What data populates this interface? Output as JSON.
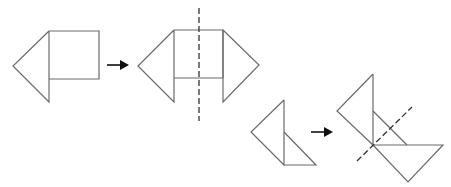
{
  "diagram": {
    "colors": {
      "stroke": "#6b6b6b",
      "dash": "#333333",
      "arrow": "#111111",
      "background": "#ffffff"
    },
    "steps": [
      {
        "id": "step1-before",
        "description": "Square with a triangle attached on its left, square's lower edge shorter than triangle",
        "polylines": [
          "49,31 13,66 49,102 49,31",
          "49,31 99,31 99,79 49,79"
        ]
      },
      {
        "id": "step1-arrow",
        "from": [
          107,
          65
        ],
        "to": [
          129,
          65
        ]
      },
      {
        "id": "step1-after",
        "description": "Mirrored shape: triangles on both sides of square, vertical dashed axis through centre",
        "polylines": [
          "174,30 138,66 174,102 174,30",
          "174,30 223,30 223,78 174,78",
          "223,30 259,65 223,102 223,30"
        ],
        "axis": {
          "x1": 199,
          "y1": 8,
          "x2": 199,
          "y2": 121
        }
      },
      {
        "id": "step2-before",
        "description": "Two triangles sharing a vertical edge",
        "polylines": [
          "284,100 251,132 284,165 284,100",
          "284,132 316,165 284,165"
        ]
      },
      {
        "id": "step2-arrow",
        "from": [
          311,
          132
        ],
        "to": [
          333,
          132
        ]
      },
      {
        "id": "step2-after",
        "description": "Shape reflected across a diagonal dashed axis",
        "polylines": [
          "373,74 337,111 373,145 373,74",
          "373,111 407,145",
          "373,145 443,145 408,182 373,145"
        ],
        "axis": {
          "x1": 357,
          "y1": 161,
          "x2": 412,
          "y2": 107
        }
      }
    ]
  }
}
